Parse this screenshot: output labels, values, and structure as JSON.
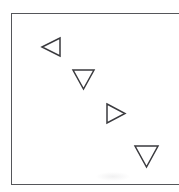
{
  "figure": {
    "name": "triangle-marker-figure",
    "background_color": "#ffffff",
    "frame": {
      "name": "frame-box",
      "stroke_color": "#55565a",
      "stroke_width": 1.4,
      "x": 11,
      "y": 13,
      "width": 172,
      "height": 172,
      "fill": "#ffffff",
      "note": "right edge cropped by image boundary"
    },
    "markers": [
      {
        "id": "marker-1",
        "icon": "triangle-left-icon",
        "direction": "left",
        "x": 41,
        "y": 37,
        "width": 20,
        "height": 20,
        "stroke_color": "#3a3a3e",
        "fill": "none"
      },
      {
        "id": "marker-2",
        "icon": "triangle-down-icon",
        "direction": "down",
        "x": 72,
        "y": 69,
        "width": 23,
        "height": 21,
        "stroke_color": "#3a3a3e",
        "fill": "none"
      },
      {
        "id": "marker-3",
        "icon": "triangle-right-icon",
        "direction": "right",
        "x": 106,
        "y": 103,
        "width": 20,
        "height": 21,
        "stroke_color": "#3a3a3e",
        "fill": "none"
      },
      {
        "id": "marker-4",
        "icon": "triangle-down-icon",
        "direction": "down",
        "x": 134,
        "y": 145,
        "width": 25,
        "height": 23,
        "stroke_color": "#3a3a3e",
        "fill": "none"
      }
    ]
  },
  "chart_data": {
    "type": "scatter",
    "title": "",
    "subtitle": "",
    "xlabel": "",
    "ylabel": "",
    "xlim": [
      0,
      172
    ],
    "ylim": [
      0,
      172
    ],
    "grid": false,
    "legend": null,
    "tick_labels": {
      "x": [],
      "y": []
    },
    "annotations": [],
    "series": [
      {
        "name": "triangle-markers",
        "marker": "triangle-outline",
        "color": "#3a3a3e",
        "points": [
          {
            "x": 40,
            "y": 125,
            "marker_direction": "left",
            "size": 20
          },
          {
            "x": 72,
            "y": 93,
            "marker_direction": "down",
            "size": 22
          },
          {
            "x": 105,
            "y": 59,
            "marker_direction": "right",
            "size": 21
          },
          {
            "x": 135,
            "y": 16,
            "marker_direction": "down",
            "size": 24
          }
        ]
      }
    ]
  }
}
